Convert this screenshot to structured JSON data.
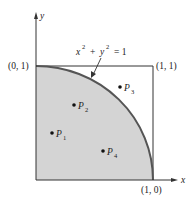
{
  "diagram": {
    "equation": {
      "text": "x² + y² = 1",
      "base_x": "x",
      "exp": "2",
      "plus": "+",
      "base_y": "y",
      "eq": "= 1"
    },
    "axes": {
      "x_label": "x",
      "y_label": "y"
    },
    "corners": {
      "top_left": "(0, 1)",
      "top_right": "(1, 1)",
      "bottom_right": "(1, 0)"
    },
    "points": [
      {
        "name": "P",
        "sub": "1",
        "x": 0.14,
        "y": 0.41
      },
      {
        "name": "P",
        "sub": "2",
        "x": 0.33,
        "y": 0.66
      },
      {
        "name": "P",
        "sub": "3",
        "x": 0.72,
        "y": 0.82
      },
      {
        "name": "P",
        "sub": "4",
        "x": 0.57,
        "y": 0.25
      }
    ],
    "colors": {
      "fill": "#d4d4d4",
      "curve": "#555555",
      "stroke": "#333333"
    }
  }
}
